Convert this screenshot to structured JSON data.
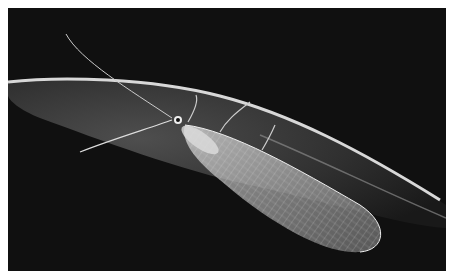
{
  "image": {
    "subject": "green lacewing insect on leaf",
    "description": "Black-and-white macro photograph of a lacewing with long antennae and translucent veined wings resting under the edge of a leaf against a black background",
    "colors": {
      "background": "#101010",
      "frame": "#ffffff",
      "leaf_edge": "#d8d8d8",
      "leaf_body": "#3a3a3a",
      "wing": "#cfcfcf"
    }
  }
}
